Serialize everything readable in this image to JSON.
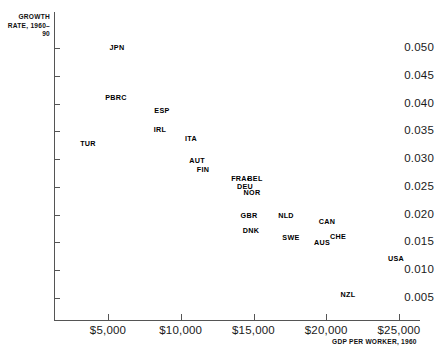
{
  "chart_data": {
    "type": "scatter",
    "title": "",
    "ylabel": "GROWTH RATE, 1960–90",
    "xlabel": "GDP PER WORKER, 1960",
    "xlim": [
      0,
      26000
    ],
    "ylim": [
      0.0025,
      0.053
    ],
    "grid": false,
    "legend": "none",
    "xticks": [
      {
        "value": 5000,
        "label": "$5,000"
      },
      {
        "value": 10000,
        "label": "$10,000"
      },
      {
        "value": 15000,
        "label": "$15,000"
      },
      {
        "value": 20000,
        "label": "$20,000"
      },
      {
        "value": 25000,
        "label": "$25,000"
      }
    ],
    "yticks": [
      {
        "value": 0.05,
        "label": "0.050"
      },
      {
        "value": 0.045,
        "label": "0.045"
      },
      {
        "value": 0.04,
        "label": "0.040"
      },
      {
        "value": 0.035,
        "label": "0.035"
      },
      {
        "value": 0.03,
        "label": "0.030"
      },
      {
        "value": 0.025,
        "label": "0.025"
      },
      {
        "value": 0.02,
        "label": "0.020"
      },
      {
        "value": 0.015,
        "label": "0.015"
      },
      {
        "value": 0.01,
        "label": "0.010"
      },
      {
        "value": 0.005,
        "label": "0.005"
      }
    ],
    "points": [
      {
        "label": "JPN",
        "x": 4300,
        "y": 0.0506,
        "px": 117,
        "py": 48,
        "anchor": "center",
        "marker": false
      },
      {
        "label": "PBRC",
        "x": 4200,
        "y": 0.0415,
        "px": 116,
        "py": 98,
        "anchor": "center",
        "marker": false
      },
      {
        "label": "ESP",
        "x": 7400,
        "y": 0.039,
        "px": 162,
        "py": 111,
        "anchor": "center",
        "marker": false
      },
      {
        "label": "IRL",
        "x": 7200,
        "y": 0.0358,
        "px": 160,
        "py": 130,
        "anchor": "center",
        "marker": false
      },
      {
        "label": "ITA",
        "x": 9300,
        "y": 0.0342,
        "px": 191,
        "py": 139,
        "anchor": "center",
        "marker": false
      },
      {
        "label": "TUR",
        "x": 2400,
        "y": 0.0335,
        "px": 88,
        "py": 144,
        "anchor": "center",
        "marker": false
      },
      {
        "label": "AUT",
        "x": 9000,
        "y": 0.0306,
        "px": 197,
        "py": 161,
        "anchor": "center",
        "marker": false
      },
      {
        "label": "FIN",
        "x": 9400,
        "y": 0.0291,
        "px": 203,
        "py": 170,
        "anchor": "center",
        "marker": false
      },
      {
        "label": "FRA",
        "x": 11800,
        "y": 0.0272,
        "px": 239,
        "py": 179,
        "anchor": "center",
        "marker": false
      },
      {
        "label": "BEL",
        "x": 12900,
        "y": 0.0271,
        "px": 255,
        "py": 179,
        "anchor": "center",
        "marker": true
      },
      {
        "label": "DEU",
        "x": 12400,
        "y": 0.0258,
        "px": 245,
        "py": 187,
        "anchor": "center",
        "marker": false
      },
      {
        "label": "NOR",
        "x": 12900,
        "y": 0.0249,
        "px": 252,
        "py": 193,
        "anchor": "center",
        "marker": false
      },
      {
        "label": "GBR",
        "x": 13100,
        "y": 0.0207,
        "px": 249,
        "py": 216,
        "anchor": "center",
        "marker": false
      },
      {
        "label": "NLD",
        "x": 15600,
        "y": 0.0207,
        "px": 286,
        "py": 216,
        "anchor": "center",
        "marker": false
      },
      {
        "label": "CAN",
        "x": 17900,
        "y": 0.0197,
        "px": 327,
        "py": 222,
        "anchor": "center",
        "marker": false
      },
      {
        "label": "DNK",
        "x": 13200,
        "y": 0.0182,
        "px": 251,
        "py": 231,
        "anchor": "center",
        "marker": false
      },
      {
        "label": "SWE",
        "x": 15500,
        "y": 0.017,
        "px": 291,
        "py": 238,
        "anchor": "center",
        "marker": false
      },
      {
        "label": "CHE",
        "x": 18500,
        "y": 0.0172,
        "px": 338,
        "py": 237,
        "anchor": "center",
        "marker": false
      },
      {
        "label": "AUS",
        "x": 17500,
        "y": 0.0162,
        "px": 322,
        "py": 243,
        "anchor": "center",
        "marker": false
      },
      {
        "label": "USA",
        "x": 23400,
        "y": 0.0124,
        "px": 396,
        "py": 259,
        "anchor": "center",
        "marker": false
      },
      {
        "label": "NZL",
        "x": 18200,
        "y": 0.0049,
        "px": 348,
        "py": 295,
        "anchor": "center",
        "marker": false
      }
    ]
  }
}
